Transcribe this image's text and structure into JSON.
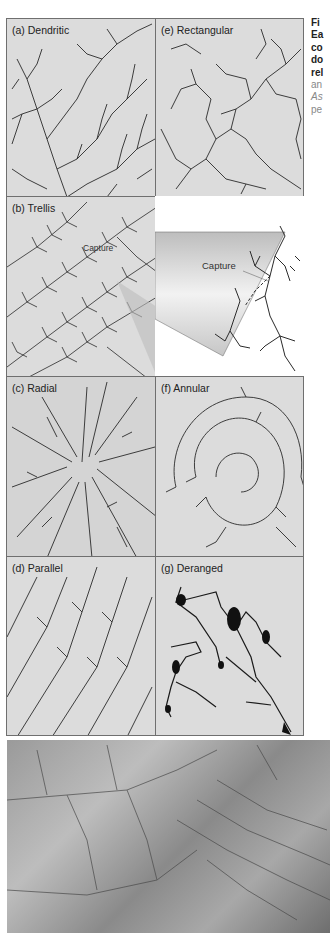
{
  "figure": {
    "caption": {
      "lines_bold": [
        "Fi",
        "Ea",
        "co",
        "do",
        "rel"
      ],
      "lines_light": [
        "an"
      ],
      "lines_italic": [
        "As"
      ],
      "lines_light2": [
        "pe"
      ]
    },
    "panels": [
      {
        "id": "a",
        "label": "(a) Dendritic"
      },
      {
        "id": "e",
        "label": "(e) Rectangular"
      },
      {
        "id": "b",
        "label": "(b) Trellis",
        "annotation": "Capture"
      },
      {
        "id": "b-inset",
        "label": "",
        "annotation": "Capture"
      },
      {
        "id": "c",
        "label": "(c) Radial"
      },
      {
        "id": "f",
        "label": "(f) Annular"
      },
      {
        "id": "d",
        "label": "(d) Parallel"
      },
      {
        "id": "g",
        "label": "(g) Deranged"
      }
    ],
    "photo": {
      "description": "aerial-terrain-photo"
    }
  },
  "colors": {
    "panel_bg": "#dcdcdc",
    "border": "#6f6f6f",
    "stream": "#2a2a2a",
    "caption_light": "#888888"
  }
}
